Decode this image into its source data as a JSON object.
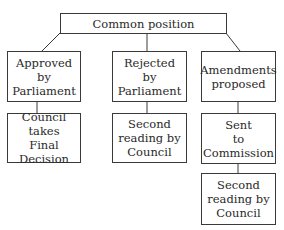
{
  "diagram": {
    "root": {
      "label": "Common position"
    },
    "branches": [
      {
        "label": "Approved\nby\nParliament",
        "children": [
          {
            "label": "Council\ntakes\nFinal Decision"
          }
        ]
      },
      {
        "label": "Rejected\nby\nParliament",
        "children": [
          {
            "label": "Second\nreading by\nCouncil"
          }
        ]
      },
      {
        "label": "Amendments\nproposed",
        "children": [
          {
            "label": "Sent\nto\nCommission"
          },
          {
            "label": "Second\nreading by\nCouncil"
          }
        ]
      }
    ]
  },
  "colors": {
    "stroke": "#3a3a3a",
    "text": "#2a2a2a",
    "background": "#ffffff"
  }
}
